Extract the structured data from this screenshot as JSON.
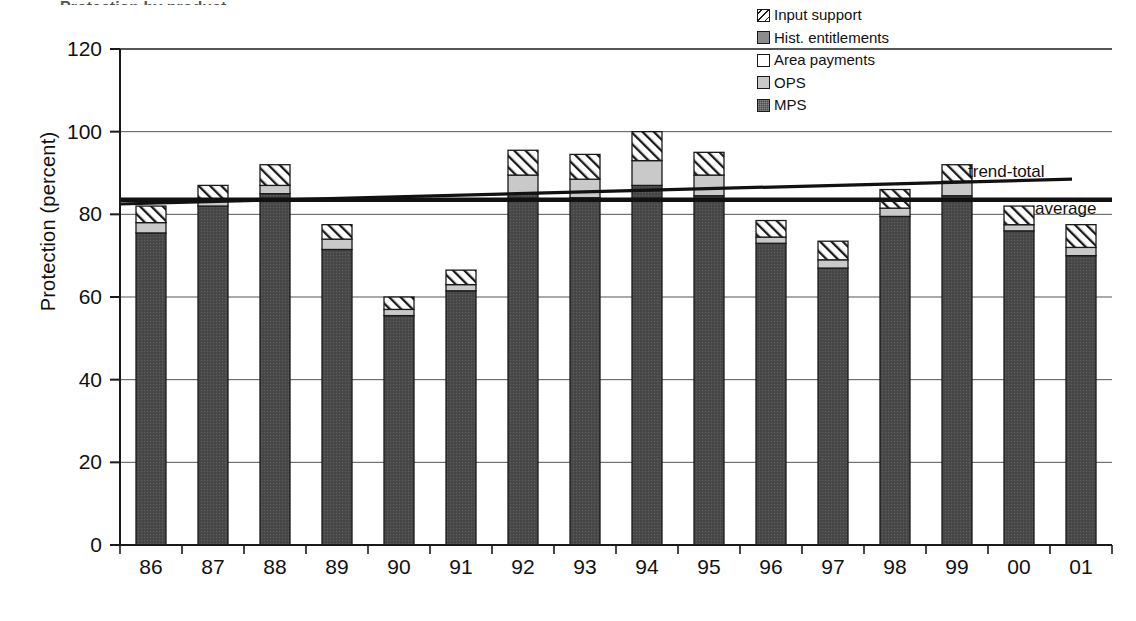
{
  "title_remnant": "Protection by product",
  "axes": {
    "ylabel": "Protection (percent)",
    "xlabel": "",
    "yticks": [
      0,
      20,
      40,
      60,
      80,
      100,
      120
    ],
    "ylim": [
      0,
      120
    ],
    "grid": "horizontal"
  },
  "legend": {
    "position": "top-right",
    "entries": [
      {
        "label": "Input support",
        "swatch": "hatch-swatch-icon"
      },
      {
        "label": "Hist. entitlements",
        "swatch": "gray-swatch-icon"
      },
      {
        "label": "Area payments",
        "swatch": "white-swatch-icon"
      },
      {
        "label": "OPS",
        "swatch": "lightgray-swatch-icon"
      },
      {
        "label": "MPS",
        "swatch": "dark-swatch-icon"
      }
    ]
  },
  "annotations": [
    {
      "name": "trend-total-label",
      "text": "trend-total"
    },
    {
      "name": "average-label",
      "text": "average"
    }
  ],
  "colors": {
    "mps": "#4a4a4a",
    "ops": "#c9c9c9",
    "area_payments": "#ffffff",
    "hist_entitlements": "#8c8c8c",
    "input_support": "#ffffff",
    "outline": "#1a1a1a",
    "grid": "#555555",
    "average_line": "#111111",
    "trend_line": "#111111"
  },
  "chart_data": {
    "type": "bar",
    "stacked": true,
    "title": "Protection by product",
    "xlabel": "",
    "ylabel": "Protection (percent)",
    "ylim": [
      0,
      120
    ],
    "yticks": [
      0,
      20,
      40,
      60,
      80,
      100,
      120
    ],
    "categories": [
      "86",
      "87",
      "88",
      "89",
      "90",
      "91",
      "92",
      "93",
      "94",
      "95",
      "96",
      "97",
      "98",
      "99",
      "00",
      "01"
    ],
    "series": [
      {
        "name": "MPS",
        "values": [
          75.5,
          82.0,
          85.0,
          71.5,
          55.5,
          61.5,
          85.0,
          84.0,
          87.0,
          84.5,
          73.0,
          67.0,
          79.5,
          84.5,
          76.0,
          70.0
        ]
      },
      {
        "name": "OPS",
        "values": [
          2.5,
          1.5,
          2.0,
          2.5,
          1.5,
          1.5,
          4.5,
          4.5,
          6.0,
          5.0,
          1.5,
          2.0,
          2.0,
          3.5,
          1.5,
          2.0
        ]
      },
      {
        "name": "Area payments",
        "values": [
          0,
          0,
          0,
          0,
          0,
          0,
          0,
          0,
          0,
          0,
          0,
          0,
          0,
          0,
          0,
          0
        ]
      },
      {
        "name": "Hist. entitlements",
        "values": [
          0,
          0,
          0,
          0,
          0,
          0,
          0,
          0,
          0,
          0,
          0,
          0,
          0,
          0,
          0,
          0
        ]
      },
      {
        "name": "Input support",
        "values": [
          4.0,
          3.5,
          5.0,
          3.5,
          3.0,
          3.5,
          6.0,
          6.0,
          7.0,
          5.5,
          4.0,
          4.5,
          4.5,
          4.0,
          4.5,
          5.5
        ]
      }
    ],
    "totals": [
      82.0,
      87.0,
      92.0,
      77.5,
      60.0,
      66.5,
      95.5,
      94.5,
      100.0,
      95.0,
      78.5,
      73.5,
      86.0,
      92.0,
      82.0,
      77.5
    ],
    "reference_lines": [
      {
        "name": "average",
        "label": "average",
        "type": "horizontal",
        "value": 83.5
      },
      {
        "name": "trend-total",
        "label": "trend-total",
        "type": "linear",
        "y_start": 82.5,
        "y_end": 88.5
      }
    ]
  }
}
